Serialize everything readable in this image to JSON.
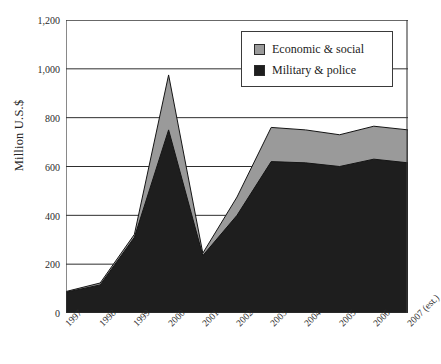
{
  "chart_data": {
    "type": "area",
    "stacked": true,
    "title": "",
    "subtitle": "",
    "xlabel": "",
    "ylabel": "Million U.S.$",
    "categories": [
      "1997",
      "1998",
      "1999",
      "2000",
      "2001",
      "2002",
      "2003",
      "2004",
      "2005",
      "2006",
      "2007 (est.)"
    ],
    "series": [
      {
        "name": "Military & police",
        "color": "#1e1e1e",
        "values": [
          85,
          115,
          310,
          750,
          235,
          400,
          620,
          615,
          600,
          630,
          615
        ]
      },
      {
        "name": "Economic & social",
        "color": "#9a9a9a",
        "values": [
          3,
          8,
          12,
          225,
          10,
          75,
          140,
          135,
          130,
          135,
          135
        ]
      }
    ],
    "totals": [
      88,
      123,
      322,
      975,
      245,
      475,
      760,
      750,
      730,
      765,
      750
    ],
    "ylim": [
      0,
      1200
    ],
    "yticks": [
      0,
      200,
      400,
      600,
      800,
      1000,
      1200
    ],
    "ytick_labels": [
      "0",
      "200",
      "400",
      "600",
      "800",
      "1,000",
      "1,200"
    ],
    "grid": true,
    "grid_axis": "y",
    "legend_position": "top-right",
    "legend_entries": [
      "Economic & social",
      "Military & police"
    ]
  },
  "axes": {
    "y_title": "Million U.S.$",
    "y_tick_labels": [
      "1,200",
      "1,000",
      "800",
      "600",
      "400",
      "200",
      "0"
    ],
    "x_tick_labels": [
      "1997",
      "1998",
      "1999",
      "2000",
      "2001",
      "2002",
      "2003",
      "2004",
      "2005",
      "2006",
      "2007 (est.)"
    ]
  },
  "legend": {
    "items": [
      {
        "label": "Economic & social",
        "color": "#9a9a9a"
      },
      {
        "label": "Military & police",
        "color": "#1e1e1e"
      }
    ]
  },
  "colors": {
    "economic_social": "#9a9a9a",
    "military_police": "#1e1e1e",
    "axis": "#3a3a3a",
    "grid": "#2e2e2e",
    "background": "#ffffff"
  }
}
